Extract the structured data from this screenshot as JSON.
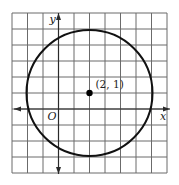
{
  "diagram": {
    "type": "coordinate-plane-circle",
    "grid": {
      "x_min": -3,
      "x_max": 7,
      "y_min": -4,
      "y_max": 6,
      "step": 1,
      "origin_px": [
        12,
        13
      ],
      "cell_w_px": 15.5,
      "cell_h_px": 16,
      "line_color": "#6b6b6b"
    },
    "axes": {
      "x_label": "x",
      "y_label": "y",
      "origin_label": "O",
      "color": "#2a2a2a"
    },
    "circle": {
      "center": [
        2,
        1
      ],
      "radius": 4,
      "color": "#111111"
    },
    "point": {
      "coords": [
        2,
        1
      ],
      "label": "(2, 1)",
      "color": "#000000"
    }
  }
}
